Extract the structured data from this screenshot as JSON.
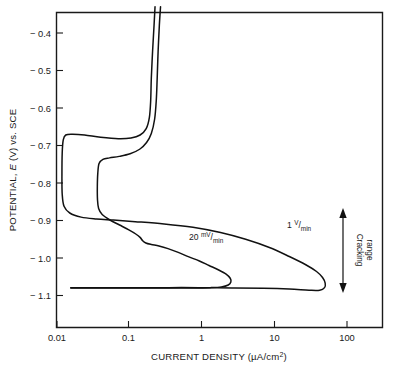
{
  "chart_data": {
    "type": "line",
    "title": "",
    "xlabel": "CURRENT DENSITY (µA/cm²)",
    "ylabel": "POTENTIAL, E (V) vs. SCE",
    "xscale": "log",
    "xlim": [
      0.008,
      200
    ],
    "ylim": [
      -1.165,
      -0.33
    ],
    "grid": false,
    "legend_position": "inline-annotations",
    "xticks": [
      {
        "value": 0.01,
        "label": "0.01"
      },
      {
        "value": 0.1,
        "label": "0.1"
      },
      {
        "value": 1,
        "label": "1"
      },
      {
        "value": 10,
        "label": "10"
      },
      {
        "value": 100,
        "label": "100"
      }
    ],
    "yticks": [
      {
        "value": -0.4,
        "label": "− 0.4"
      },
      {
        "value": -0.5,
        "label": "− 0.5"
      },
      {
        "value": -0.6,
        "label": "− 0.6"
      },
      {
        "value": -0.7,
        "label": "− 0.7"
      },
      {
        "value": -0.8,
        "label": "− 0.8"
      },
      {
        "value": -0.9,
        "label": "− 0.9"
      },
      {
        "value": -1.0,
        "label": "− 1.0"
      },
      {
        "value": -1.1,
        "label": "− 1.1"
      }
    ],
    "series": [
      {
        "name": "1 V/min",
        "label_number": "1",
        "label_numerator": "V",
        "label_denominator": "min",
        "scan_rate": "1 V/min",
        "points": [
          [
            0.225,
            -0.33
          ],
          [
            0.218,
            -0.38
          ],
          [
            0.208,
            -0.45
          ],
          [
            0.2,
            -0.52
          ],
          [
            0.196,
            -0.58
          ],
          [
            0.188,
            -0.625
          ],
          [
            0.17,
            -0.655
          ],
          [
            0.14,
            -0.672
          ],
          [
            0.105,
            -0.68
          ],
          [
            0.07,
            -0.682
          ],
          [
            0.04,
            -0.678
          ],
          [
            0.024,
            -0.672
          ],
          [
            0.0165,
            -0.67
          ],
          [
            0.0132,
            -0.672
          ],
          [
            0.0122,
            -0.685
          ],
          [
            0.0118,
            -0.72
          ],
          [
            0.0117,
            -0.78
          ],
          [
            0.0118,
            -0.83
          ],
          [
            0.0125,
            -0.862
          ],
          [
            0.015,
            -0.88
          ],
          [
            0.0215,
            -0.891
          ],
          [
            0.035,
            -0.896
          ],
          [
            0.06,
            -0.899
          ],
          [
            0.12,
            -0.903
          ],
          [
            0.3,
            -0.909
          ],
          [
            0.75,
            -0.918
          ],
          [
            1.8,
            -0.932
          ],
          [
            4.0,
            -0.95
          ],
          [
            8.5,
            -0.972
          ],
          [
            16.0,
            -0.996
          ],
          [
            27.0,
            -1.018
          ],
          [
            38.0,
            -1.036
          ],
          [
            46.0,
            -1.052
          ],
          [
            50.0,
            -1.067
          ],
          [
            49.0,
            -1.079
          ],
          [
            42.0,
            -1.086
          ],
          [
            30.0,
            -1.086
          ],
          [
            16.0,
            -1.083
          ],
          [
            7.0,
            -1.081
          ],
          [
            2.6,
            -1.08
          ],
          [
            0.9,
            -1.079
          ],
          [
            0.35,
            -1.079
          ],
          [
            0.13,
            -1.079
          ],
          [
            0.048,
            -1.079
          ],
          [
            0.022,
            -1.079
          ],
          [
            0.0155,
            -1.079
          ]
        ]
      },
      {
        "name": "20 mV/min",
        "label_number": "20",
        "label_numerator": "mV",
        "label_denominator": "min",
        "scan_rate": "20 mV/min",
        "points": [
          [
            0.268,
            -0.33
          ],
          [
            0.258,
            -0.38
          ],
          [
            0.248,
            -0.45
          ],
          [
            0.241,
            -0.52
          ],
          [
            0.234,
            -0.58
          ],
          [
            0.222,
            -0.63
          ],
          [
            0.2,
            -0.668
          ],
          [
            0.172,
            -0.692
          ],
          [
            0.138,
            -0.71
          ],
          [
            0.102,
            -0.722
          ],
          [
            0.072,
            -0.729
          ],
          [
            0.053,
            -0.733
          ],
          [
            0.043,
            -0.737
          ],
          [
            0.038,
            -0.748
          ],
          [
            0.0365,
            -0.775
          ],
          [
            0.036,
            -0.81
          ],
          [
            0.0362,
            -0.845
          ],
          [
            0.0375,
            -0.868
          ],
          [
            0.042,
            -0.884
          ],
          [
            0.053,
            -0.898
          ],
          [
            0.073,
            -0.912
          ],
          [
            0.098,
            -0.925
          ],
          [
            0.122,
            -0.936
          ],
          [
            0.14,
            -0.945
          ],
          [
            0.152,
            -0.954
          ],
          [
            0.168,
            -0.96
          ],
          [
            0.2,
            -0.964
          ],
          [
            0.255,
            -0.968
          ],
          [
            0.34,
            -0.975
          ],
          [
            0.47,
            -0.985
          ],
          [
            0.66,
            -0.997
          ],
          [
            0.92,
            -1.008
          ],
          [
            1.25,
            -1.02
          ],
          [
            1.7,
            -1.032
          ],
          [
            2.15,
            -1.043
          ],
          [
            2.45,
            -1.054
          ],
          [
            2.5,
            -1.064
          ],
          [
            2.3,
            -1.072
          ],
          [
            1.85,
            -1.077
          ],
          [
            1.3,
            -1.079
          ],
          [
            0.8,
            -1.08
          ],
          [
            0.46,
            -1.08
          ],
          [
            0.27,
            -1.08
          ],
          [
            0.155,
            -1.08
          ],
          [
            0.072,
            -1.08
          ],
          [
            0.032,
            -1.08
          ],
          [
            0.0155,
            -1.08
          ]
        ]
      }
    ],
    "annotations": [
      {
        "name": "cracking-range",
        "text_line1": "Cracking",
        "text_line2": "range",
        "type": "double-arrow-vertical",
        "y_top": -0.908,
        "y_bottom": -1.11,
        "x_position": 140
      }
    ]
  },
  "figure": {
    "background_color": "#ffffff",
    "line_color": "#111111",
    "text_color": "#1a1a1a"
  }
}
